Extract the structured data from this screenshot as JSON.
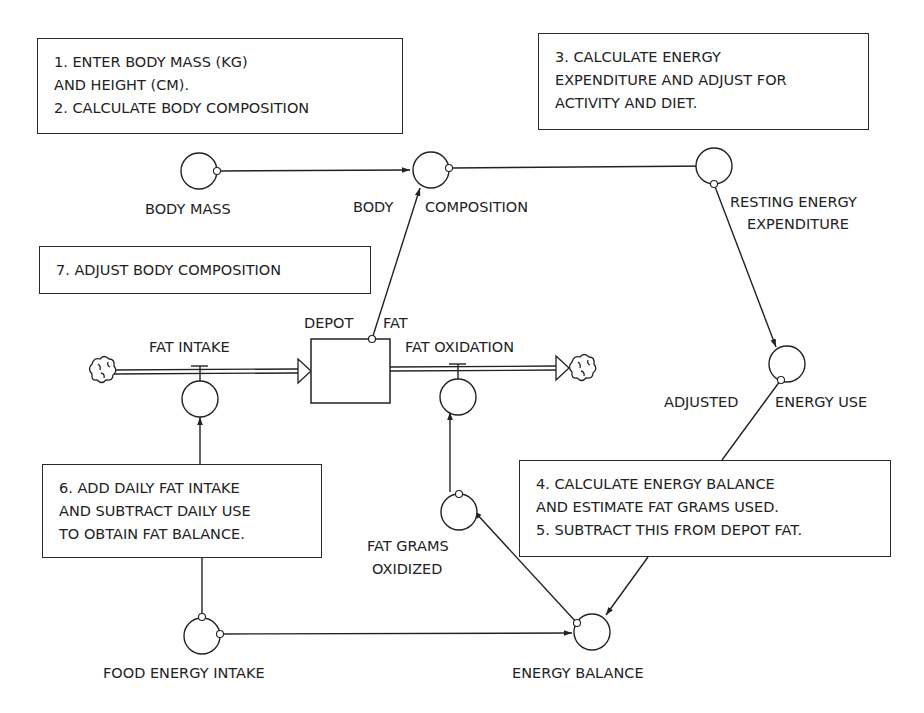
{
  "notes": {
    "step1_2": [
      "1. ENTER BODY MASS (KG)",
      "AND HEIGHT (CM).",
      "2. CALCULATE BODY COMPOSITION"
    ],
    "step3": [
      "3. CALCULATE ENERGY",
      "EXPENDITURE AND ADJUST FOR",
      "ACTIVITY AND DIET."
    ],
    "step7": [
      "7. ADJUST BODY COMPOSITION"
    ],
    "step6": [
      "6. ADD DAILY FAT INTAKE",
      "AND SUBTRACT DAILY USE",
      "TO OBTAIN FAT BALANCE."
    ],
    "step4_5": [
      "4. CALCULATE ENERGY BALANCE",
      "AND ESTIMATE FAT GRAMS USED.",
      "5. SUBTRACT THIS FROM DEPOT FAT."
    ]
  },
  "nodes": {
    "body_mass": "BODY MASS",
    "body_composition_a": "BODY",
    "body_composition_b": "COMPOSITION",
    "resting_energy_a": "RESTING ENERGY",
    "resting_energy_b": "EXPENDITURE",
    "depot_fat_a": "DEPOT",
    "depot_fat_b": "FAT",
    "fat_intake": "FAT INTAKE",
    "fat_oxidation": "FAT OXIDATION",
    "adjusted_energy_a": "ADJUSTED",
    "adjusted_energy_b": "ENERGY USE",
    "fat_grams_a": "FAT GRAMS",
    "fat_grams_b": "OXIDIZED",
    "food_energy_intake": "FOOD ENERGY INTAKE",
    "energy_balance": "ENERGY BALANCE"
  },
  "colors": {
    "ink": "#222222",
    "background": "#ffffff"
  }
}
